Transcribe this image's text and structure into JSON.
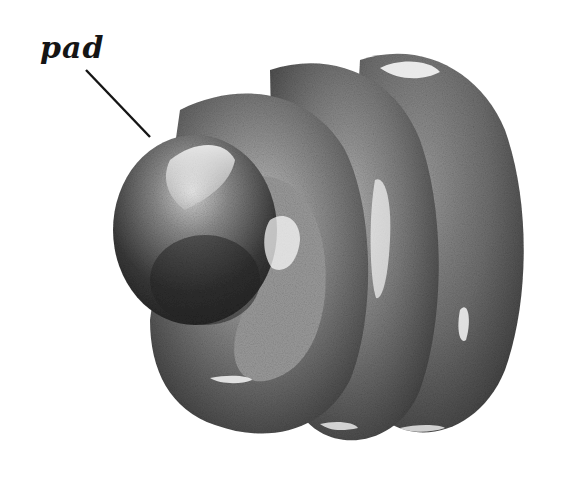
{
  "illustration": {
    "subject": "pencil drawing of a coiled ridged structure with a rounded pad",
    "style": "graphite pencil shading, grayscale",
    "label": {
      "text": "pad",
      "leader_line": {
        "from": [
          86,
          70
        ],
        "to": [
          150,
          137
        ]
      }
    },
    "colors": {
      "background": "#ffffff",
      "ink": "#151515",
      "shade_dark": "#2e2e2e",
      "shade_mid": "#6a6a6a",
      "shade_light": "#a8a8a8",
      "highlight": "#f4f4f4"
    }
  }
}
